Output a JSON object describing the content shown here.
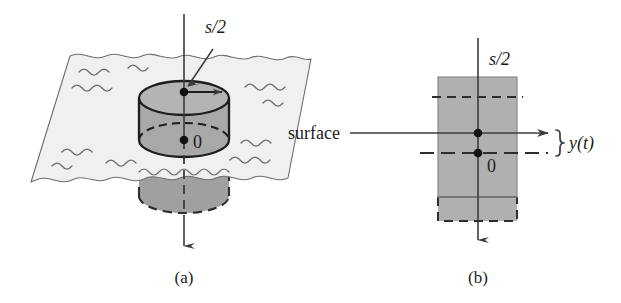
{
  "figure": {
    "panels": [
      {
        "id": "panel-a",
        "caption": "(a)",
        "labels": {
          "half_stroke": "s/2",
          "origin": "0"
        },
        "description": "Cylindrical buoy floating in water; vertical axis arrow points downward; radius arrow labeled s/2 on top cap; origin 0 at equilibrium water line"
      },
      {
        "id": "panel-b",
        "caption": "(b)",
        "labels": {
          "half_stroke": "s/2",
          "origin": "0",
          "surface": "surface",
          "displacement": "y(t)"
        },
        "description": "Side view: rectangle cross-section of buoy with surface line, displaced dashed position, and brace marking displacement y(t)"
      }
    ],
    "colors": {
      "water_fill": "#f0f0f0",
      "cylinder_fill": "#a8a8a8",
      "cylinder_fill_light": "#b4b4b4",
      "rect_fill": "#b0b0b0",
      "line": "#3c3c3c",
      "text": "#1c1c1c",
      "background": "#ffffff"
    }
  }
}
